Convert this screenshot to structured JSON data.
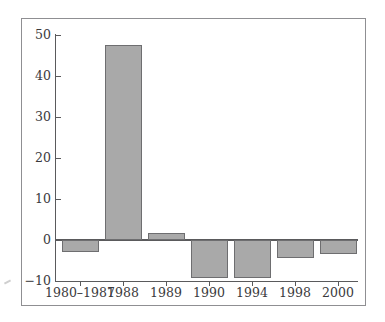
{
  "chart_data": {
    "type": "bar",
    "title": "",
    "subtitle": "",
    "xlabel": "",
    "ylabel": "",
    "categories": [
      "1980–1987",
      "1988",
      "1989",
      "1990",
      "1994",
      "1998",
      "2000"
    ],
    "values": [
      -3.0,
      47.5,
      1.7,
      -9.3,
      -9.3,
      -4.5,
      -3.5
    ],
    "series": [
      {
        "name": "",
        "values": [
          -3.0,
          47.5,
          1.7,
          -9.3,
          -9.3,
          -4.5,
          -3.5
        ]
      }
    ],
    "ylim": [
      -10,
      50
    ],
    "yticks": [
      -10,
      0,
      10,
      20,
      30,
      40,
      50
    ],
    "ytick_labels": [
      "−10",
      "0",
      "10",
      "20",
      "30",
      "40",
      "50"
    ],
    "grid": false,
    "legend": null,
    "legend_position": "none",
    "bar_color": "#a9a9a9",
    "bar_edge_color": "#6e6e70",
    "axis_color": "#5a5a5c",
    "frame_color": "#8f8f92",
    "background": "#ffffff",
    "annotations": []
  },
  "figure": {
    "frame_present": true,
    "stray_mark": true
  }
}
